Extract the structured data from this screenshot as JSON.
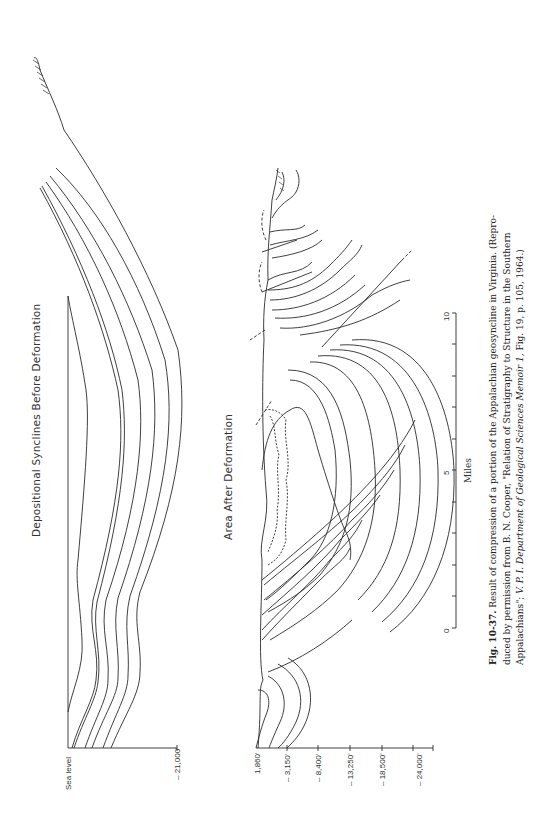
{
  "figure": {
    "number": "Fig. 10-37.",
    "caption_line1_rest": " Result of compression of a portion of the Appalachian geosyncline in Virginia. (Repro-",
    "caption_line2": "duced by permission from B. N. Cooper, \"Relation of Stratigraphy to Structure in the Southern",
    "caption_line3_pre": "Appalachians\"; ",
    "caption_line3_italic": "V. P. I. Department of Geological Sciences Memoir 1,",
    "caption_line3_post": " Fig. 19, p. 105, 1964.)"
  },
  "upper_section": {
    "title": "Depositional Synclines Before Deformation",
    "axis_labels": [
      "Sea  level",
      "– 21,000'"
    ]
  },
  "lower_section": {
    "title": "Area After Deformation",
    "depth_labels": [
      "1,860'",
      "– 3,150'",
      "– 8,400'",
      "– 13,250'",
      "– 18,500'",
      "– 24,000'"
    ]
  },
  "scale_bar": {
    "unit": "Miles",
    "ticks": [
      "0",
      "5",
      "10"
    ]
  },
  "colors": {
    "line": "#2a2a2a",
    "background": "#ffffff"
  }
}
